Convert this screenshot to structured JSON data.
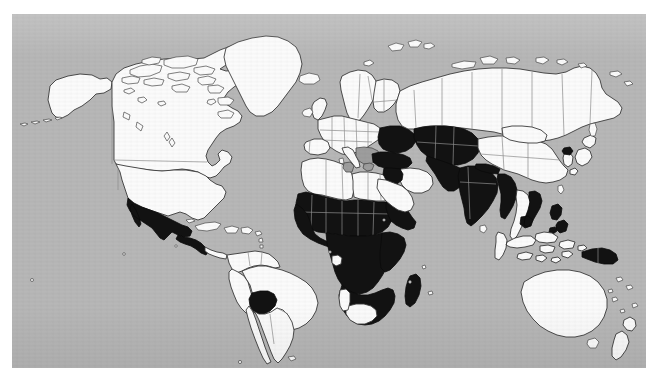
{
  "figure": {
    "kind": "world-choropleth-map",
    "projection": "equirectangular",
    "panel": {
      "x": 12,
      "y": 14,
      "width": 634,
      "height": 354,
      "ocean_color": "#b7b7b7",
      "page_background": "#ffffff"
    },
    "legend_visible": false,
    "title_visible": false,
    "axis_visible": false,
    "labels_visible": false
  },
  "colors": {
    "ocean": "#b7b7b7",
    "land_unshaded": "#fbfbfb",
    "land_shaded": "#121212",
    "land_intermediate": "#9d9d9d",
    "coastline": "#3a3a3a",
    "internal_border": "#8e8e8e"
  },
  "chart_data": {
    "type": "map",
    "title": "",
    "subtitle": "",
    "xlabel": "",
    "ylabel": "",
    "legend": [],
    "categories": [
      "shaded",
      "intermediate",
      "unshaded"
    ],
    "category_colors": [
      "#121212",
      "#9d9d9d",
      "#fbfbfb"
    ],
    "regions": [
      {
        "name": "Mexico",
        "category": "shaded",
        "value": 1
      },
      {
        "name": "Guatemala",
        "category": "shaded",
        "value": 1
      },
      {
        "name": "Honduras",
        "category": "shaded",
        "value": 1
      },
      {
        "name": "Nicaragua",
        "category": "shaded",
        "value": 1
      },
      {
        "name": "Bolivia",
        "category": "shaded",
        "value": 1
      },
      {
        "name": "Mauritania",
        "category": "shaded",
        "value": 1
      },
      {
        "name": "Mali",
        "category": "shaded",
        "value": 1
      },
      {
        "name": "Niger",
        "category": "shaded",
        "value": 1
      },
      {
        "name": "Chad",
        "category": "shaded",
        "value": 1
      },
      {
        "name": "Sudan",
        "category": "shaded",
        "value": 1
      },
      {
        "name": "Senegal",
        "category": "shaded",
        "value": 1
      },
      {
        "name": "Guinea",
        "category": "shaded",
        "value": 1
      },
      {
        "name": "Sierra Leone",
        "category": "shaded",
        "value": 1
      },
      {
        "name": "Liberia",
        "category": "shaded",
        "value": 1
      },
      {
        "name": "Cote d'Ivoire",
        "category": "shaded",
        "value": 1
      },
      {
        "name": "Ghana",
        "category": "shaded",
        "value": 1
      },
      {
        "name": "Togo",
        "category": "shaded",
        "value": 1
      },
      {
        "name": "Benin",
        "category": "shaded",
        "value": 1
      },
      {
        "name": "Nigeria",
        "category": "shaded",
        "value": 1
      },
      {
        "name": "Cameroon",
        "category": "shaded",
        "value": 1
      },
      {
        "name": "Central African Republic",
        "category": "shaded",
        "value": 1
      },
      {
        "name": "Ethiopia",
        "category": "shaded",
        "value": 1
      },
      {
        "name": "Somalia",
        "category": "shaded",
        "value": 1
      },
      {
        "name": "Kenya",
        "category": "shaded",
        "value": 1
      },
      {
        "name": "Uganda",
        "category": "shaded",
        "value": 1
      },
      {
        "name": "Tanzania",
        "category": "shaded",
        "value": 1
      },
      {
        "name": "Democratic Republic of the Congo",
        "category": "shaded",
        "value": 1
      },
      {
        "name": "Congo",
        "category": "shaded",
        "value": 1
      },
      {
        "name": "Angola",
        "category": "shaded",
        "value": 1
      },
      {
        "name": "Zambia",
        "category": "shaded",
        "value": 1
      },
      {
        "name": "Zimbabwe",
        "category": "shaded",
        "value": 1
      },
      {
        "name": "Mozambique",
        "category": "shaded",
        "value": 1
      },
      {
        "name": "Malawi",
        "category": "shaded",
        "value": 1
      },
      {
        "name": "Madagascar",
        "category": "shaded",
        "value": 1
      },
      {
        "name": "Turkey",
        "category": "shaded",
        "value": 1
      },
      {
        "name": "Syria",
        "category": "shaded",
        "value": 1
      },
      {
        "name": "Iraq",
        "category": "shaded",
        "value": 1
      },
      {
        "name": "Kazakhstan",
        "category": "shaded",
        "value": 1
      },
      {
        "name": "Uzbekistan",
        "category": "shaded",
        "value": 1
      },
      {
        "name": "Turkmenistan",
        "category": "shaded",
        "value": 1
      },
      {
        "name": "Kyrgyzstan",
        "category": "shaded",
        "value": 1
      },
      {
        "name": "Tajikistan",
        "category": "shaded",
        "value": 1
      },
      {
        "name": "Afghanistan",
        "category": "shaded",
        "value": 1
      },
      {
        "name": "Pakistan",
        "category": "shaded",
        "value": 1
      },
      {
        "name": "India",
        "category": "shaded",
        "value": 1
      },
      {
        "name": "Nepal",
        "category": "shaded",
        "value": 1
      },
      {
        "name": "Bangladesh",
        "category": "shaded",
        "value": 1
      },
      {
        "name": "Myanmar",
        "category": "shaded",
        "value": 1
      },
      {
        "name": "Laos",
        "category": "shaded",
        "value": 1
      },
      {
        "name": "Cambodia",
        "category": "shaded",
        "value": 1
      },
      {
        "name": "Vietnam",
        "category": "shaded",
        "value": 1
      },
      {
        "name": "Philippines",
        "category": "shaded",
        "value": 1
      },
      {
        "name": "North Korea",
        "category": "shaded",
        "value": 1
      },
      {
        "name": "Ukraine",
        "category": "shaded",
        "value": 1
      },
      {
        "name": "Papua New Guinea",
        "category": "shaded",
        "value": 1
      },
      {
        "name": "United States",
        "category": "unshaded",
        "value": 0
      },
      {
        "name": "Canada",
        "category": "unshaded",
        "value": 0
      },
      {
        "name": "Greenland",
        "category": "unshaded",
        "value": 0
      },
      {
        "name": "Brazil",
        "category": "unshaded",
        "value": 0
      },
      {
        "name": "Argentina",
        "category": "unshaded",
        "value": 0
      },
      {
        "name": "Chile",
        "category": "unshaded",
        "value": 0
      },
      {
        "name": "Peru",
        "category": "unshaded",
        "value": 0
      },
      {
        "name": "Colombia",
        "category": "unshaded",
        "value": 0
      },
      {
        "name": "Venezuela",
        "category": "unshaded",
        "value": 0
      },
      {
        "name": "Russia",
        "category": "unshaded",
        "value": 0
      },
      {
        "name": "China",
        "category": "unshaded",
        "value": 0
      },
      {
        "name": "Mongolia",
        "category": "unshaded",
        "value": 0
      },
      {
        "name": "Australia",
        "category": "unshaded",
        "value": 0
      },
      {
        "name": "New Zealand",
        "category": "unshaded",
        "value": 0
      },
      {
        "name": "Indonesia",
        "category": "unshaded",
        "value": 0
      },
      {
        "name": "Saudi Arabia",
        "category": "unshaded",
        "value": 0
      },
      {
        "name": "Iran",
        "category": "unshaded",
        "value": 0
      },
      {
        "name": "South Africa",
        "category": "unshaded",
        "value": 0
      },
      {
        "name": "Namibia",
        "category": "unshaded",
        "value": 0
      },
      {
        "name": "Botswana",
        "category": "unshaded",
        "value": 0
      },
      {
        "name": "Gabon",
        "category": "unshaded",
        "value": 0
      },
      {
        "name": "Libya",
        "category": "unshaded",
        "value": 0
      },
      {
        "name": "Egypt",
        "category": "unshaded",
        "value": 0
      },
      {
        "name": "Algeria",
        "category": "unshaded",
        "value": 0
      },
      {
        "name": "Morocco",
        "category": "unshaded",
        "value": 0
      },
      {
        "name": "France",
        "category": "unshaded",
        "value": 0
      },
      {
        "name": "Spain",
        "category": "unshaded",
        "value": 0
      },
      {
        "name": "Germany",
        "category": "unshaded",
        "value": 0
      },
      {
        "name": "Poland",
        "category": "unshaded",
        "value": 0
      },
      {
        "name": "Sweden",
        "category": "unshaded",
        "value": 0
      },
      {
        "name": "Norway",
        "category": "unshaded",
        "value": 0
      },
      {
        "name": "Finland",
        "category": "unshaded",
        "value": 0
      },
      {
        "name": "United Kingdom",
        "category": "unshaded",
        "value": 0
      },
      {
        "name": "Japan",
        "category": "unshaded",
        "value": 0
      },
      {
        "name": "South Korea",
        "category": "unshaded",
        "value": 0
      },
      {
        "name": "Thailand",
        "category": "unshaded",
        "value": 0
      },
      {
        "name": "Malaysia",
        "category": "unshaded",
        "value": 0
      },
      {
        "name": "Tunisia",
        "category": "intermediate",
        "value": 0.5
      },
      {
        "name": "Italy-Balkans area",
        "category": "intermediate",
        "value": 0.5
      }
    ]
  }
}
